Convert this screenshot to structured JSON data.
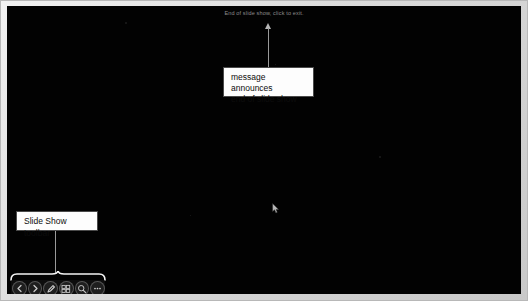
{
  "app": {
    "name": "PowerPoint Slide Show",
    "mode": "End of slide show (black screen)"
  },
  "slide": {
    "background_color": "#020202",
    "frame_color": "#dcdcdc",
    "end_message": "End of slide show, click to exit."
  },
  "annotations": [
    {
      "id": "message-callout",
      "line1": "message announces",
      "line2": "end of slide show",
      "text": "message announces end of slide show",
      "box_color": "#fdfdfd",
      "border_color": "#4a4a4a",
      "text_color": "#0d0d0d"
    },
    {
      "id": "toolbar-callout",
      "text": "Slide Show toolbar",
      "box_color": "#fdfdfd",
      "border_color": "#4a4a4a",
      "text_color": "#0d0d0d"
    }
  ],
  "toolbar": {
    "label": "Slide Show toolbar",
    "buttons": [
      {
        "name": "previous-slide-button",
        "icon": "arrow-left-icon",
        "tooltip": "Previous"
      },
      {
        "name": "next-slide-button",
        "icon": "arrow-right-icon",
        "tooltip": "Next"
      },
      {
        "name": "pen-button",
        "icon": "pen-icon",
        "tooltip": "Pen"
      },
      {
        "name": "all-slides-button",
        "icon": "grid-icon",
        "tooltip": "See all slides"
      },
      {
        "name": "zoom-button",
        "icon": "magnifier-icon",
        "tooltip": "Zoom into the slide"
      },
      {
        "name": "more-options-button",
        "icon": "ellipsis-icon",
        "tooltip": "More slide show options"
      }
    ]
  },
  "cursor": {
    "name": "mouse-pointer",
    "x": 267,
    "y": 203
  }
}
